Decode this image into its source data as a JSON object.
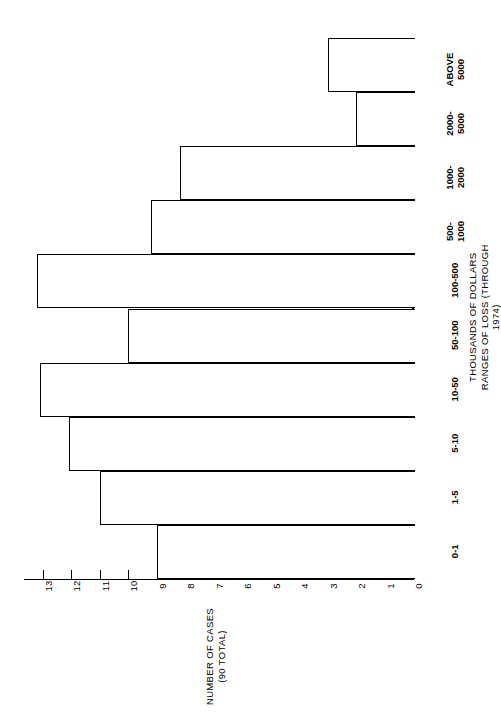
{
  "chart_data": {
    "type": "bar",
    "orientation": "horizontal-rotated",
    "title": "",
    "xlabel": "THOUSANDS OF DOLLARS\nRANGES OF LOSS (THROUGH 1974)",
    "ylabel": "NUMBER OF CASES\n(90 TOTAL)",
    "categories": [
      "0-1",
      "1-5",
      "5-10",
      "10-50",
      "50-100",
      "100-500",
      "500-\n1000",
      "1000-\n2000",
      "2000-\n5000",
      "ABOVE\n5000"
    ],
    "values": [
      9,
      11,
      12.1,
      13.1,
      10,
      13.2,
      9.2,
      8.2,
      2,
      3
    ],
    "ylim": [
      0,
      13.6
    ],
    "axis_ticks": [
      13,
      12,
      11,
      10,
      9,
      8,
      7,
      6,
      5,
      4,
      3,
      2,
      1,
      0
    ],
    "grid": false,
    "legend": null,
    "total_cases": 90
  },
  "axis": {
    "value_title_line1": "NUMBER OF CASES",
    "value_title_line2": "(90 TOTAL)",
    "category_title_line1": "THOUSANDS OF DOLLARS",
    "category_title_line2": "RANGES OF LOSS (THROUGH 1974)"
  }
}
